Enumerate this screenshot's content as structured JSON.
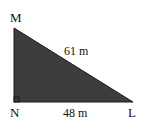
{
  "diagram": {
    "type": "right-triangle",
    "vertices": [
      {
        "name": "M",
        "label": "M"
      },
      {
        "name": "N",
        "label": "N"
      },
      {
        "name": "L",
        "label": "L"
      }
    ],
    "right_angle_at": "N",
    "sides": {
      "hypotenuse_ML": "61 m",
      "base_NL": "48 m"
    },
    "colors": {
      "fill": "#3d3d3d",
      "stroke": "#1a1a1a"
    }
  }
}
